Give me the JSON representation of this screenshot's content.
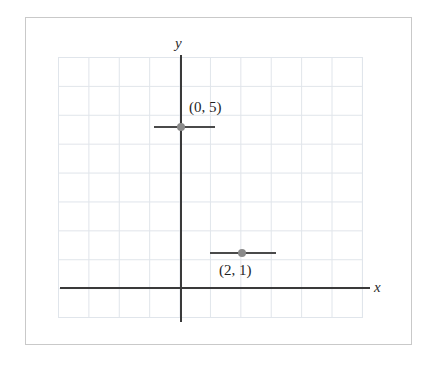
{
  "figure": {
    "kind": "coordinate-plane-graph",
    "background_color": "#ffffff",
    "frame_border_color": "#c9c9c9",
    "grid_line_color": "#dfe4ea",
    "axis_color": "#3a3a3a",
    "point_color": "#8a8a8a",
    "segment_color": "#4a4a4a"
  },
  "axes": {
    "x_label": "x",
    "y_label": "y",
    "grid": {
      "columns": 10,
      "rows": 9,
      "visible": true
    }
  },
  "points": [
    {
      "id": "point-0-5",
      "label": "(0, 5)",
      "x": 0,
      "y": 5,
      "marker": "filled-circle",
      "has_horizontal_segment": true
    },
    {
      "id": "point-2-1",
      "label": "(2, 1)",
      "x": 2,
      "y": 1,
      "marker": "filled-circle",
      "has_horizontal_segment": true
    }
  ],
  "chart_data": {
    "type": "scatter",
    "title": "",
    "xlabel": "x",
    "ylabel": "y",
    "grid": true,
    "legend": "none",
    "xlim": [
      -4,
      6
    ],
    "ylim": [
      -1,
      8
    ],
    "points": [
      {
        "label": "(0, 5)",
        "x": 0,
        "y": 5
      },
      {
        "label": "(2, 1)",
        "x": 2,
        "y": 1
      }
    ],
    "annotations": [
      "(0, 5)",
      "(2, 1)"
    ]
  }
}
